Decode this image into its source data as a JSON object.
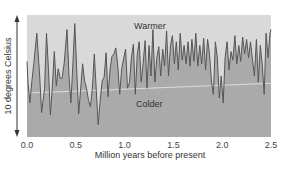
{
  "chart_data": {
    "type": "area",
    "title": "",
    "xlabel": "Million years before present",
    "ylabel": "10 degrees Celsius",
    "xlim": [
      0.0,
      2.5
    ],
    "ylim": [
      0,
      10
    ],
    "x_ticks": [
      "0.0",
      "0.5",
      "1.0",
      "1.5",
      "2.0",
      "2.5"
    ],
    "annotations": {
      "warm": "Warmer",
      "cold": "Colder"
    },
    "grid": false,
    "colors": {
      "warm_bg": "#d9d9d9",
      "cold_fill": "#aaaaaa",
      "line": "#555555",
      "trend": "#e8e8e8"
    },
    "series": [
      {
        "name": "temperature",
        "x": [
          0.0,
          0.01,
          0.03,
          0.05,
          0.07,
          0.1,
          0.13,
          0.15,
          0.18,
          0.2,
          0.22,
          0.24,
          0.26,
          0.28,
          0.3,
          0.32,
          0.34,
          0.36,
          0.38,
          0.41,
          0.43,
          0.45,
          0.47,
          0.49,
          0.51,
          0.53,
          0.55,
          0.57,
          0.59,
          0.61,
          0.63,
          0.65,
          0.67,
          0.69,
          0.71,
          0.73,
          0.75,
          0.77,
          0.79,
          0.81,
          0.83,
          0.85,
          0.87,
          0.89,
          0.91,
          0.93,
          0.95,
          0.97,
          0.99,
          1.01,
          1.03,
          1.05,
          1.07,
          1.09,
          1.11,
          1.13,
          1.15,
          1.17,
          1.19,
          1.21,
          1.23,
          1.25,
          1.27,
          1.29,
          1.31,
          1.33,
          1.35,
          1.37,
          1.39,
          1.41,
          1.43,
          1.45,
          1.47,
          1.49,
          1.51,
          1.53,
          1.55,
          1.57,
          1.59,
          1.61,
          1.63,
          1.65,
          1.67,
          1.69,
          1.71,
          1.73,
          1.75,
          1.77,
          1.79,
          1.81,
          1.83,
          1.85,
          1.87,
          1.89,
          1.91,
          1.93,
          1.95,
          1.97,
          1.99,
          2.01,
          2.03,
          2.05,
          2.07,
          2.09,
          2.11,
          2.13,
          2.15,
          2.17,
          2.19,
          2.21,
          2.23,
          2.25,
          2.27,
          2.29,
          2.31,
          2.33,
          2.35,
          2.37,
          2.39,
          2.41,
          2.43,
          2.45,
          2.47,
          2.49,
          2.5
        ],
        "y": [
          6.2,
          4.5,
          2.8,
          4.6,
          6.0,
          8.5,
          5.0,
          2.0,
          4.0,
          8.5,
          5.5,
          1.8,
          4.2,
          7.0,
          4.2,
          5.6,
          4.8,
          4.8,
          6.0,
          8.8,
          5.0,
          2.8,
          6.0,
          9.3,
          5.3,
          1.9,
          4.0,
          6.0,
          4.6,
          4.0,
          3.0,
          2.5,
          4.0,
          6.8,
          3.8,
          1.0,
          3.0,
          4.6,
          4.9,
          6.9,
          3.3,
          5.5,
          6.6,
          6.8,
          7.3,
          5.8,
          3.5,
          5.6,
          6.4,
          7.2,
          4.0,
          4.5,
          6.5,
          7.6,
          3.5,
          6.8,
          7.8,
          4.5,
          6.0,
          7.9,
          4.0,
          7.5,
          5.0,
          8.8,
          4.5,
          6.5,
          7.4,
          5.0,
          7.2,
          5.8,
          8.7,
          5.0,
          7.5,
          8.3,
          6.0,
          7.8,
          5.5,
          8.5,
          6.3,
          7.5,
          6.0,
          7.8,
          5.8,
          8.0,
          6.2,
          8.5,
          5.8,
          7.5,
          6.0,
          8.1,
          5.5,
          8.0,
          6.8,
          4.5,
          3.5,
          7.8,
          6.5,
          3.2,
          5.0,
          2.8,
          6.5,
          7.8,
          5.5,
          7.0,
          6.3,
          8.3,
          6.0,
          7.5,
          6.2,
          8.2,
          6.8,
          8.0,
          6.5,
          7.8,
          6.3,
          5.0,
          8.0,
          4.5,
          7.5,
          6.0,
          3.5,
          8.5,
          6.5,
          8.5,
          8.8
        ]
      }
    ],
    "trend": {
      "x": [
        0.0,
        2.5
      ],
      "y": [
        3.6,
        4.4
      ]
    }
  }
}
